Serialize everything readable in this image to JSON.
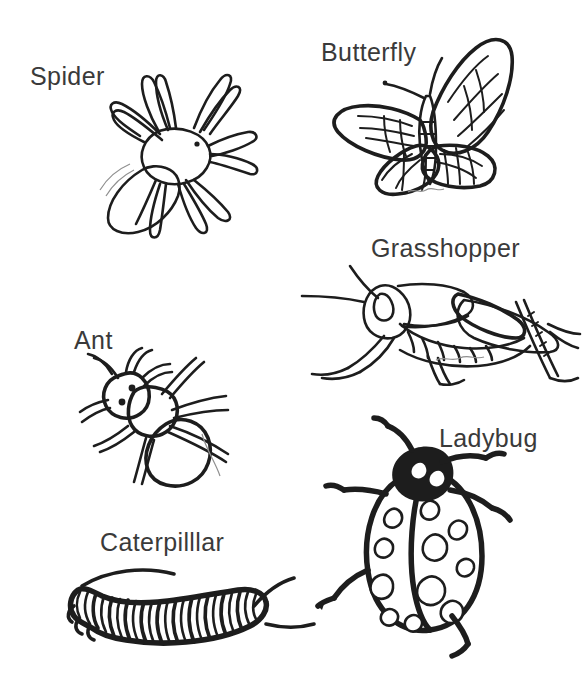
{
  "page": {
    "kind": "coloring-worksheet",
    "background_color": "#ffffff",
    "ink_color": "#1d1d1d",
    "label_color": "#3a3a3a",
    "width": 582,
    "height": 698
  },
  "figures": [
    {
      "id": "spider",
      "label": "Spider",
      "icon": "spider-icon",
      "label_x": 30,
      "label_y": 64,
      "legs": 8,
      "notes": "eight-legged spider, oval cephalothorax with one eye dot, rounded abdomen lower left"
    },
    {
      "id": "butterfly",
      "label": "Butterfly",
      "icon": "butterfly-icon",
      "label_x": 321,
      "label_y": 40,
      "wings": 4,
      "notes": "butterfly with patterned upper and lower wings, two antennae, segmented body"
    },
    {
      "id": "grasshopper",
      "label": "Grasshopper",
      "icon": "grasshopper-icon",
      "label_x": 371,
      "label_y": 236,
      "legs": 6,
      "notes": "grasshopper facing left with long antennae, wing cover and large jumping hind leg"
    },
    {
      "id": "ant",
      "label": "Ant",
      "icon": "ant-icon",
      "label_x": 74,
      "label_y": 328,
      "legs": 6,
      "notes": "ant with two eyes, bent antennae, narrow thorax and large oval abdomen"
    },
    {
      "id": "ladybug",
      "label": "Ladybug",
      "icon": "ladybug-icon",
      "label_x": 439,
      "label_y": 426,
      "legs": 6,
      "spots": 11,
      "notes": "ladybug seen from above, solid black head, oval shell split by centre line with spots"
    },
    {
      "id": "caterpillar",
      "label": "Caterpilllar",
      "icon": "caterpillar-icon",
      "label_x": 100,
      "label_y": 530,
      "notes": "striped segmented caterpillar with curved front and rear filaments; label is spelled with three l's in the original sheet"
    }
  ]
}
